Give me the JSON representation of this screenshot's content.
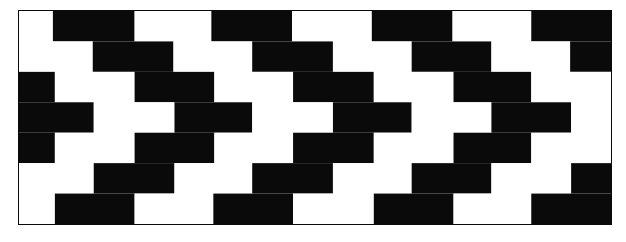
{
  "figure": {
    "background_color": "#ffffff",
    "border_color": "#0a0a0a",
    "dark_color": "#0a0a0a",
    "light_color": "#ffffff",
    "frame": {
      "x": 18,
      "y": 10,
      "width": 594,
      "height": 215,
      "border_width": 1
    },
    "grid": {
      "rows": 7,
      "row_height": 30.7,
      "brick_width": 79,
      "offset_even_rows": 39.5,
      "columns_per_row": 7.5
    },
    "rows": [
      {
        "index": 1,
        "offset": 0,
        "cells": [
          {
            "color": "light",
            "x": 0,
            "width": 34
          },
          {
            "color": "dark",
            "x": 34,
            "width": 82
          },
          {
            "color": "light",
            "x": 116,
            "width": 77
          },
          {
            "color": "dark",
            "x": 193,
            "width": 81
          },
          {
            "color": "light",
            "x": 274,
            "width": 80
          },
          {
            "color": "dark",
            "x": 354,
            "width": 81
          },
          {
            "color": "light",
            "x": 435,
            "width": 79
          },
          {
            "color": "dark",
            "x": 514,
            "width": 80
          }
        ]
      },
      {
        "index": 2,
        "offset": 39,
        "cells": [
          {
            "color": "light",
            "x": 0,
            "width": 74
          },
          {
            "color": "dark",
            "x": 74,
            "width": 81
          },
          {
            "color": "light",
            "x": 155,
            "width": 79
          },
          {
            "color": "dark",
            "x": 234,
            "width": 81
          },
          {
            "color": "light",
            "x": 315,
            "width": 79
          },
          {
            "color": "dark",
            "x": 394,
            "width": 80
          },
          {
            "color": "light",
            "x": 474,
            "width": 79
          },
          {
            "color": "dark",
            "x": 553,
            "width": 41
          }
        ]
      },
      {
        "index": 3,
        "offset": 0,
        "cells": [
          {
            "color": "dark",
            "x": 0,
            "width": 36
          },
          {
            "color": "light",
            "x": 36,
            "width": 80
          },
          {
            "color": "dark",
            "x": 116,
            "width": 80
          },
          {
            "color": "light",
            "x": 196,
            "width": 79
          },
          {
            "color": "dark",
            "x": 275,
            "width": 81
          },
          {
            "color": "light",
            "x": 356,
            "width": 80
          },
          {
            "color": "dark",
            "x": 436,
            "width": 78
          },
          {
            "color": "light",
            "x": 514,
            "width": 80
          }
        ]
      },
      {
        "index": 4,
        "offset": 39,
        "cells": [
          {
            "color": "dark",
            "x": 0,
            "width": 75
          },
          {
            "color": "light",
            "x": 75,
            "width": 81
          },
          {
            "color": "dark",
            "x": 156,
            "width": 78
          },
          {
            "color": "light",
            "x": 234,
            "width": 81
          },
          {
            "color": "dark",
            "x": 315,
            "width": 79
          },
          {
            "color": "light",
            "x": 394,
            "width": 80
          },
          {
            "color": "dark",
            "x": 474,
            "width": 80
          },
          {
            "color": "light",
            "x": 554,
            "width": 40
          }
        ]
      },
      {
        "index": 5,
        "offset": 0,
        "cells": [
          {
            "color": "dark",
            "x": 0,
            "width": 36
          },
          {
            "color": "light",
            "x": 36,
            "width": 80
          },
          {
            "color": "dark",
            "x": 116,
            "width": 80
          },
          {
            "color": "light",
            "x": 196,
            "width": 79
          },
          {
            "color": "dark",
            "x": 275,
            "width": 81
          },
          {
            "color": "light",
            "x": 356,
            "width": 80
          },
          {
            "color": "dark",
            "x": 436,
            "width": 78
          },
          {
            "color": "light",
            "x": 514,
            "width": 80
          }
        ]
      },
      {
        "index": 6,
        "offset": 39,
        "cells": [
          {
            "color": "light",
            "x": 0,
            "width": 75
          },
          {
            "color": "dark",
            "x": 75,
            "width": 81
          },
          {
            "color": "light",
            "x": 156,
            "width": 78
          },
          {
            "color": "dark",
            "x": 234,
            "width": 81
          },
          {
            "color": "light",
            "x": 315,
            "width": 79
          },
          {
            "color": "dark",
            "x": 394,
            "width": 80
          },
          {
            "color": "light",
            "x": 474,
            "width": 80
          },
          {
            "color": "dark",
            "x": 554,
            "width": 40
          }
        ]
      },
      {
        "index": 7,
        "offset": 0,
        "cells": [
          {
            "color": "light",
            "x": 0,
            "width": 36
          },
          {
            "color": "dark",
            "x": 36,
            "width": 80
          },
          {
            "color": "light",
            "x": 116,
            "width": 79
          },
          {
            "color": "dark",
            "x": 195,
            "width": 80
          },
          {
            "color": "light",
            "x": 275,
            "width": 81
          },
          {
            "color": "dark",
            "x": 356,
            "width": 80
          },
          {
            "color": "light",
            "x": 436,
            "width": 78
          },
          {
            "color": "dark",
            "x": 514,
            "width": 80
          }
        ]
      }
    ]
  }
}
